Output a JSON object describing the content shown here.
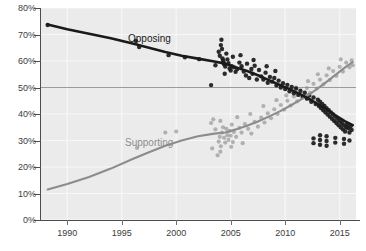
{
  "chart_data": {
    "type": "scatter",
    "title": "",
    "subtitle": "",
    "xlabel": "",
    "ylabel": "",
    "xlim": [
      1987.5,
      2016.5
    ],
    "ylim": [
      0,
      80
    ],
    "grid": true,
    "legend_position": "inline-annotation",
    "xticks": [
      1990,
      1995,
      2000,
      2005,
      2010,
      2015
    ],
    "xtick_labels": [
      "1990",
      "1995",
      "2000",
      "2005",
      "2010",
      "2015"
    ],
    "yticks": [
      0,
      10,
      20,
      30,
      40,
      50,
      60,
      70,
      80
    ],
    "ytick_labels": [
      "0%",
      "10%",
      "20%",
      "30%",
      "40%",
      "50%",
      "60%",
      "70%",
      "80%"
    ],
    "highlight_gridline": 50,
    "annotations": [
      {
        "text": "Opposing",
        "x": 1996.5,
        "y": 73,
        "color": "#1a1a1a"
      },
      {
        "text": "Supporting",
        "x": 1996.2,
        "y": 35,
        "color": "#8c8c8c"
      }
    ],
    "series": [
      {
        "name": "Opposing",
        "color": "#1a1a1a",
        "trend": [
          [
            1988.2,
            73.8
          ],
          [
            1990,
            72.0
          ],
          [
            1992,
            70.3
          ],
          [
            1994,
            68.6
          ],
          [
            1996,
            66.6
          ],
          [
            1997.5,
            65.0
          ],
          [
            1999,
            63.4
          ],
          [
            2000.5,
            62.0
          ],
          [
            2002,
            60.9
          ],
          [
            2003.5,
            59.8
          ],
          [
            2004.5,
            59.0
          ],
          [
            2005.5,
            57.6
          ],
          [
            2006.5,
            56.2
          ],
          [
            2007.5,
            54.6
          ],
          [
            2008.5,
            52.8
          ],
          [
            2009.5,
            51.0
          ],
          [
            2010.5,
            49.2
          ],
          [
            2011.5,
            47.2
          ],
          [
            2012.5,
            45.0
          ],
          [
            2013.5,
            42.5
          ],
          [
            2014.5,
            39.8
          ],
          [
            2015.5,
            37.2
          ],
          [
            2016.2,
            35.8
          ]
        ],
        "points": [
          [
            1988.2,
            73.6
          ],
          [
            1996.3,
            67.6
          ],
          [
            1996.6,
            65.3
          ],
          [
            1999.3,
            62.2
          ],
          [
            2000.8,
            61.4
          ],
          [
            2002.1,
            60.7
          ],
          [
            2003.2,
            50.9
          ],
          [
            2003.6,
            58.4
          ],
          [
            2003.9,
            63.5
          ],
          [
            2004.0,
            62.0
          ],
          [
            2004.1,
            66.0
          ],
          [
            2004.15,
            68.0
          ],
          [
            2004.2,
            64.5
          ],
          [
            2004.25,
            61.0
          ],
          [
            2004.3,
            60.2
          ],
          [
            2004.35,
            59.4
          ],
          [
            2004.4,
            58.8
          ],
          [
            2004.5,
            57.9
          ],
          [
            2004.6,
            62.8
          ],
          [
            2004.7,
            60.6
          ],
          [
            2004.8,
            59.2
          ],
          [
            2004.9,
            57.2
          ],
          [
            2005.0,
            56.4
          ],
          [
            2005.1,
            58.0
          ],
          [
            2005.2,
            61.6
          ],
          [
            2005.3,
            57.6
          ],
          [
            2005.45,
            55.9
          ],
          [
            2005.6,
            57.0
          ],
          [
            2005.8,
            59.4
          ],
          [
            2006.0,
            58.0
          ],
          [
            2006.2,
            56.0
          ],
          [
            2006.4,
            54.5
          ],
          [
            2006.5,
            59.0
          ],
          [
            2006.7,
            53.6
          ],
          [
            2006.9,
            57.0
          ],
          [
            2007.0,
            55.2
          ],
          [
            2007.2,
            58.2
          ],
          [
            2007.4,
            53.0
          ],
          [
            2007.6,
            56.6
          ],
          [
            2007.8,
            54.2
          ],
          [
            2008.0,
            53.0
          ],
          [
            2008.2,
            55.6
          ],
          [
            2008.4,
            51.8
          ],
          [
            2008.6,
            54.0
          ],
          [
            2008.8,
            52.2
          ],
          [
            2009.0,
            53.6
          ],
          [
            2009.2,
            50.8
          ],
          [
            2009.4,
            52.6
          ],
          [
            2009.6,
            50.0
          ],
          [
            2009.8,
            51.6
          ],
          [
            2010.0,
            49.4
          ],
          [
            2010.2,
            51.0
          ],
          [
            2010.4,
            48.6
          ],
          [
            2010.6,
            50.2
          ],
          [
            2010.8,
            47.8
          ],
          [
            2011.0,
            49.6
          ],
          [
            2011.2,
            47.2
          ],
          [
            2011.4,
            48.8
          ],
          [
            2011.6,
            46.4
          ],
          [
            2011.8,
            48.0
          ],
          [
            2012.0,
            45.8
          ],
          [
            2012.2,
            47.0
          ],
          [
            2012.4,
            44.6
          ],
          [
            2012.6,
            46.2
          ],
          [
            2012.8,
            43.8
          ],
          [
            2013.0,
            45.4
          ],
          [
            2013.1,
            43.0
          ],
          [
            2013.2,
            44.6
          ],
          [
            2013.3,
            42.2
          ],
          [
            2013.4,
            43.8
          ],
          [
            2013.5,
            41.4
          ],
          [
            2013.6,
            43.0
          ],
          [
            2013.7,
            40.6
          ],
          [
            2013.8,
            42.2
          ],
          [
            2013.9,
            39.8
          ],
          [
            2014.0,
            41.4
          ],
          [
            2014.1,
            39.0
          ],
          [
            2014.2,
            40.6
          ],
          [
            2014.3,
            38.2
          ],
          [
            2014.4,
            39.8
          ],
          [
            2014.5,
            37.4
          ],
          [
            2014.6,
            39.0
          ],
          [
            2014.7,
            36.6
          ],
          [
            2014.8,
            38.2
          ],
          [
            2014.9,
            35.8
          ],
          [
            2015.0,
            37.4
          ],
          [
            2015.1,
            35.0
          ],
          [
            2015.2,
            36.6
          ],
          [
            2015.3,
            34.2
          ],
          [
            2015.4,
            35.8
          ],
          [
            2015.5,
            33.4
          ],
          [
            2015.6,
            35.0
          ],
          [
            2015.7,
            36.2
          ],
          [
            2015.8,
            34.6
          ],
          [
            2015.9,
            33.0
          ],
          [
            2016.0,
            35.4
          ],
          [
            2016.1,
            34.0
          ],
          [
            2013.2,
            32.0
          ],
          [
            2013.2,
            30.2
          ],
          [
            2013.2,
            28.4
          ],
          [
            2013.8,
            31.6
          ],
          [
            2013.8,
            29.8
          ],
          [
            2013.8,
            28.0
          ],
          [
            2014.6,
            31.0
          ],
          [
            2014.6,
            29.2
          ],
          [
            2015.4,
            30.6
          ],
          [
            2015.4,
            28.8
          ],
          [
            2015.9,
            30.0
          ],
          [
            2012.6,
            30.8
          ],
          [
            2012.6,
            29.0
          ],
          [
            2004.45,
            55.2
          ],
          [
            2005.9,
            62.2
          ],
          [
            2007.1,
            60.4
          ],
          [
            2008.3,
            58.0
          ],
          [
            2009.1,
            56.2
          ]
        ]
      },
      {
        "name": "Supporting",
        "color": "#8c8c8c",
        "trend": [
          [
            1988.2,
            11.5
          ],
          [
            1990,
            13.6
          ],
          [
            1992,
            16.2
          ],
          [
            1994,
            19.4
          ],
          [
            1996,
            23.0
          ],
          [
            1997.5,
            25.6
          ],
          [
            1999,
            28.0
          ],
          [
            2000.5,
            30.0
          ],
          [
            2002,
            31.6
          ],
          [
            2003.5,
            32.6
          ],
          [
            2004.5,
            33.0
          ],
          [
            2005.5,
            34.2
          ],
          [
            2006.5,
            35.6
          ],
          [
            2007.5,
            37.2
          ],
          [
            2008.5,
            39.0
          ],
          [
            2009.5,
            41.0
          ],
          [
            2010.5,
            43.2
          ],
          [
            2011.5,
            45.6
          ],
          [
            2012.5,
            48.2
          ],
          [
            2013.5,
            51.2
          ],
          [
            2014.5,
            54.4
          ],
          [
            2015.5,
            57.6
          ],
          [
            2016.2,
            59.6
          ]
        ],
        "points": [
          [
            1996.4,
            27.2
          ],
          [
            1999.0,
            33.0
          ],
          [
            2000.0,
            33.4
          ],
          [
            2003.2,
            36.6
          ],
          [
            2003.6,
            34.2
          ],
          [
            2003.9,
            29.6
          ],
          [
            2004.0,
            31.4
          ],
          [
            2004.1,
            27.8
          ],
          [
            2004.2,
            33.0
          ],
          [
            2004.3,
            35.0
          ],
          [
            2004.4,
            31.0
          ],
          [
            2004.5,
            29.2
          ],
          [
            2004.6,
            34.4
          ],
          [
            2004.7,
            32.0
          ],
          [
            2004.8,
            30.2
          ],
          [
            2004.9,
            33.6
          ],
          [
            2005.0,
            31.8
          ],
          [
            2005.1,
            36.0
          ],
          [
            2005.2,
            29.4
          ],
          [
            2005.3,
            33.2
          ],
          [
            2005.5,
            31.4
          ],
          [
            2005.8,
            34.8
          ],
          [
            2006.0,
            33.0
          ],
          [
            2006.3,
            36.2
          ],
          [
            2006.6,
            34.4
          ],
          [
            2006.9,
            32.6
          ],
          [
            2007.2,
            37.0
          ],
          [
            2007.5,
            35.2
          ],
          [
            2007.8,
            38.6
          ],
          [
            2008.1,
            36.8
          ],
          [
            2008.4,
            40.2
          ],
          [
            2008.7,
            38.4
          ],
          [
            2009.0,
            41.8
          ],
          [
            2009.3,
            40.0
          ],
          [
            2009.6,
            43.4
          ],
          [
            2009.9,
            41.6
          ],
          [
            2010.2,
            45.0
          ],
          [
            2010.5,
            43.2
          ],
          [
            2010.8,
            46.6
          ],
          [
            2011.1,
            44.8
          ],
          [
            2011.4,
            48.2
          ],
          [
            2011.7,
            46.4
          ],
          [
            2012.0,
            49.8
          ],
          [
            2012.3,
            48.0
          ],
          [
            2012.6,
            51.4
          ],
          [
            2012.9,
            49.6
          ],
          [
            2013.2,
            53.0
          ],
          [
            2013.5,
            51.2
          ],
          [
            2013.8,
            54.6
          ],
          [
            2014.1,
            52.8
          ],
          [
            2014.4,
            56.2
          ],
          [
            2014.7,
            54.4
          ],
          [
            2015.0,
            57.8
          ],
          [
            2015.3,
            56.0
          ],
          [
            2015.6,
            59.4
          ],
          [
            2015.9,
            57.6
          ],
          [
            2016.1,
            60.2
          ],
          [
            2016.2,
            58.4
          ],
          [
            2003.4,
            38.0
          ],
          [
            2004.05,
            37.4
          ],
          [
            2005.6,
            38.8
          ],
          [
            2006.8,
            40.0
          ],
          [
            2008.0,
            43.0
          ],
          [
            2009.2,
            45.2
          ],
          [
            2010.1,
            47.0
          ],
          [
            2011.0,
            50.0
          ],
          [
            2012.1,
            52.4
          ],
          [
            2013.0,
            55.0
          ],
          [
            2014.0,
            57.2
          ],
          [
            2015.1,
            60.6
          ],
          [
            2003.3,
            27.0
          ],
          [
            2004.05,
            25.8
          ],
          [
            2005.05,
            27.6
          ],
          [
            2006.1,
            29.0
          ],
          [
            2003.8,
            24.4
          ]
        ]
      }
    ]
  }
}
